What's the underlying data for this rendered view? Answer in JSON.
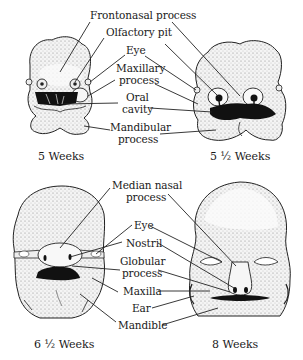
{
  "figure": {
    "panels": [
      {
        "id": "5wk",
        "caption": "5 Weeks"
      },
      {
        "id": "5_5wk",
        "caption": "5 ½ Weeks"
      },
      {
        "id": "6_5wk",
        "caption": "6 ½ Weeks"
      },
      {
        "id": "8wk",
        "caption": "8 Weeks"
      }
    ],
    "top_labels": {
      "frontonasal": "Frontonasal process",
      "olfactory": "Olfactory pit",
      "eye": "Eye",
      "maxillary_1": "Maxillary",
      "maxillary_2": "process",
      "oral_1": "Oral",
      "oral_2": "cavity",
      "mandibular_1": "Mandibular",
      "mandibular_2": "process"
    },
    "bottom_labels": {
      "median_1": "Median nasal",
      "median_2": "process",
      "eye": "Eye",
      "nostril": "Nostril",
      "globular_1": "Globular",
      "globular_2": "process",
      "maxilla": "Maxilla",
      "ear": "Ear",
      "mandible": "Mandible"
    },
    "colors": {
      "ink": "#1a1a1a",
      "skin": "#f2f2f2",
      "background": "#ffffff"
    }
  }
}
